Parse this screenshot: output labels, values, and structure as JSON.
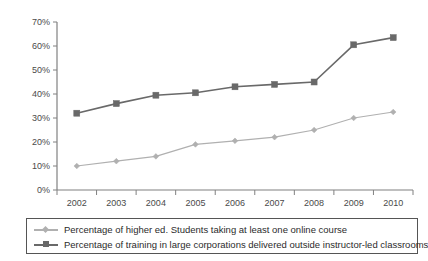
{
  "chart_data": {
    "type": "line",
    "title": "",
    "subtitle": "",
    "xlabel": "",
    "ylabel": "",
    "categories": [
      "2002",
      "2003",
      "2004",
      "2005",
      "2006",
      "2007",
      "2008",
      "2009",
      "2010"
    ],
    "x": [
      2002,
      2003,
      2004,
      2005,
      2006,
      2007,
      2008,
      2009,
      2010
    ],
    "ylim": [
      0,
      70
    ],
    "ytick_values": [
      0,
      10,
      20,
      30,
      40,
      50,
      60,
      70
    ],
    "ytick_labels": [
      "0%",
      "10%",
      "20%",
      "30%",
      "40%",
      "50%",
      "60%",
      "70%"
    ],
    "grid": false,
    "legend_position": "bottom",
    "series": [
      {
        "name": "Percentage of higher ed. Students taking at least one online course",
        "color": "#b0b0b0",
        "marker": "diamond",
        "values": [
          10,
          12,
          14,
          19,
          20.5,
          22,
          25,
          30,
          32.5
        ]
      },
      {
        "name": "Percentage of training in large corporations delivered outside instructor-led classrooms",
        "color": "#696969",
        "marker": "square",
        "values": [
          32,
          36,
          39.5,
          40.5,
          43,
          44,
          45,
          60.5,
          63.5
        ]
      }
    ]
  },
  "legend": {
    "entries": [
      {
        "label": "Percentage of higher ed. Students taking at least one online course"
      },
      {
        "label": "Percentage of training in large corporations delivered outside instructor-led classrooms"
      }
    ]
  },
  "axes": {
    "axis_color": "#808080",
    "tick_color": "#808080"
  }
}
